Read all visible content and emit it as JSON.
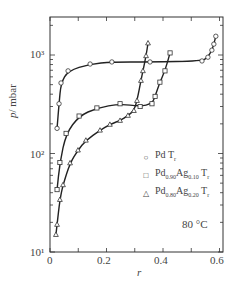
{
  "chart_data": {
    "type": "line",
    "title": "",
    "xlabel": "r",
    "ylabel": "p / mbar",
    "xlim": [
      0,
      0.62
    ],
    "ylim": [
      10,
      1500
    ],
    "yscale": "log",
    "x_ticks": [
      "0",
      "0.2",
      "0.4",
      "0.6"
    ],
    "y_ticks": [
      "10¹",
      "10²",
      "10³"
    ],
    "annotation": "80 °C",
    "legend_position": "right-middle",
    "series": [
      {
        "name": "Pd Tr",
        "marker": "circle",
        "x": [
          0.025,
          0.032,
          0.039,
          0.064,
          0.142,
          0.219,
          0.354,
          0.538,
          0.559,
          0.573,
          0.58,
          0.587
        ],
        "y": [
          180,
          320,
          520,
          690,
          810,
          850,
          850,
          870,
          950,
          1120,
          1290,
          1550
        ]
      },
      {
        "name": "Pd0.90Ag0.10 Tr",
        "marker": "square",
        "x": [
          0.025,
          0.035,
          0.057,
          0.103,
          0.166,
          0.248,
          0.319,
          0.361,
          0.372,
          0.389,
          0.407,
          0.425
        ],
        "y": [
          43,
          81,
          160,
          240,
          290,
          320,
          300,
          320,
          380,
          530,
          690,
          1050
        ]
      },
      {
        "name": "Pd0.80Ag0.20 Tr",
        "marker": "triangle",
        "x": [
          0.021,
          0.025,
          0.035,
          0.046,
          0.071,
          0.099,
          0.127,
          0.177,
          0.212,
          0.248,
          0.276,
          0.297,
          0.308,
          0.322,
          0.329,
          0.34,
          0.347
        ],
        "y": [
          15,
          19,
          34,
          48,
          80,
          108,
          136,
          172,
          197,
          216,
          243,
          272,
          344,
          550,
          690,
          980,
          1320
        ]
      }
    ]
  },
  "labels": {
    "ylabel_italic": "p",
    "ylabel_unit": "/ mbar",
    "xlabel": "r",
    "ytick_1000": "10³",
    "ytick_100": "10²",
    "ytick_10": "10¹",
    "xtick_0": "0",
    "xtick_02": "0.2",
    "xtick_04": "0.4",
    "xtick_06": "0.6",
    "temperature": "80 °C"
  },
  "legend": [
    {
      "symbol": "○",
      "base": "Pd",
      "sub1": "",
      "mid": "",
      "sub2": "",
      "tail": " T",
      "tail_sub": "r"
    },
    {
      "symbol": "□",
      "base": "Pd",
      "sub1": "0.90",
      "mid": "Ag",
      "sub2": "0.10",
      "tail": " T",
      "tail_sub": "r"
    },
    {
      "symbol": "△",
      "base": "Pd",
      "sub1": "0.80",
      "mid": "Ag",
      "sub2": "0.20",
      "tail": " T",
      "tail_sub": "r"
    }
  ]
}
